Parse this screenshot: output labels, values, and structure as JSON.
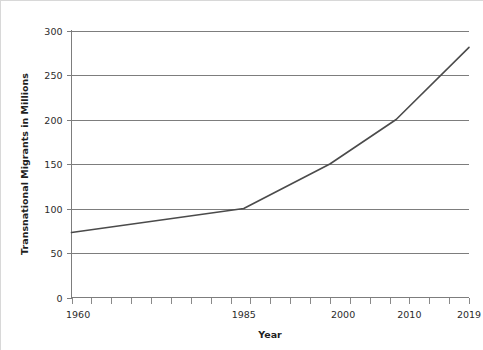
{
  "chart_data": {
    "type": "line",
    "title": "",
    "subtitle": "",
    "xlabel": "Year",
    "ylabel": "Transnational Migrants in Millions",
    "xlim": [
      1959,
      2019
    ],
    "ylim": [
      0,
      300
    ],
    "grid": true,
    "legend": "none",
    "y_ticks": [
      0,
      50,
      100,
      150,
      200,
      250,
      300
    ],
    "y_tick_labels": [
      "0",
      "50",
      "100",
      "150",
      "200",
      "250",
      "300"
    ],
    "x_tick_labels": [
      "1960",
      "1985",
      "2000",
      "2010",
      "2019"
    ],
    "x_tick_values": [
      1960,
      1985,
      2000,
      2010,
      2019
    ],
    "x_minor_tick_count": 21,
    "series": [
      {
        "name": "Transnational Migrants",
        "color": "#4b4b4b",
        "x": [
          1959,
          1985,
          1998,
          2008,
          2019
        ],
        "values": [
          73,
          100,
          150,
          200,
          281
        ]
      }
    ]
  },
  "axes": {
    "y_axis_title": "Transnational Migrants in Millions",
    "x_axis_title": "Year"
  },
  "style": {
    "line_color": "#4b4b4b",
    "grid_color": "#7d7d7d",
    "axis_color": "#7d7d7d",
    "text_color": "#2b2b2b",
    "background": "#ffffff"
  }
}
